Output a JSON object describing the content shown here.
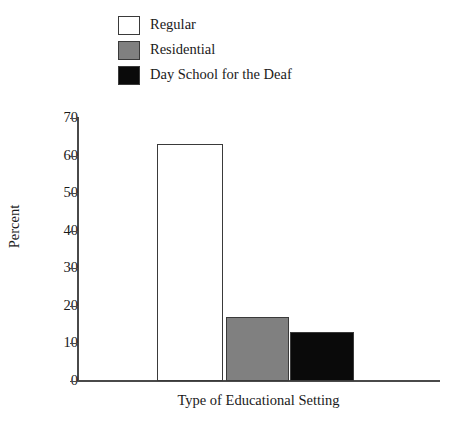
{
  "legend": {
    "items": [
      {
        "label": "Regular",
        "color": "#ffffff",
        "swatch_name": "legend-swatch-regular"
      },
      {
        "label": "Residential",
        "color": "#808080",
        "swatch_name": "legend-swatch-residential"
      },
      {
        "label": "Day School for the Deaf",
        "color": "#0a0a0a",
        "swatch_name": "legend-swatch-day-school"
      }
    ]
  },
  "chart_data": {
    "type": "bar",
    "title": "",
    "xlabel": "Type of Educational Setting",
    "ylabel": "Percent",
    "categories": [
      "Regular",
      "Residential",
      "Day School for the Deaf"
    ],
    "values": [
      63,
      17,
      13
    ],
    "colors": [
      "#ffffff",
      "#808080",
      "#0a0a0a"
    ],
    "ylim": [
      0,
      70
    ],
    "yticks": [
      0,
      10,
      20,
      30,
      40,
      50,
      60,
      70
    ],
    "ytick_labels": [
      "0",
      "10",
      "20",
      "30",
      "40",
      "50",
      "60",
      "70"
    ],
    "grid": false,
    "legend_position": "top-left"
  }
}
